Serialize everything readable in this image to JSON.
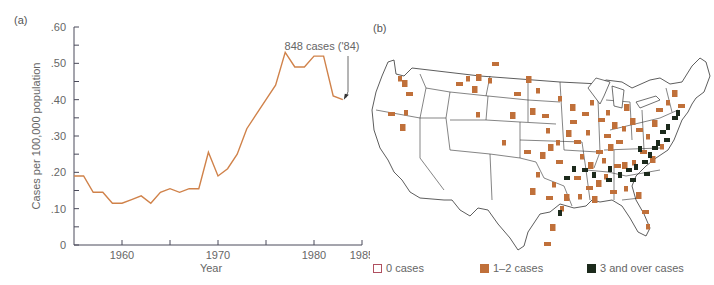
{
  "panel_a_label": "(a)",
  "panel_b_label": "(b)",
  "chart_data": [
    {
      "type": "line",
      "title": "",
      "xlabel": "Year",
      "ylabel": "Cases per 100,000 population",
      "x": [
        1955,
        1956,
        1957,
        1958,
        1959,
        1960,
        1961,
        1962,
        1963,
        1964,
        1965,
        1966,
        1967,
        1968,
        1969,
        1970,
        1971,
        1972,
        1973,
        1974,
        1975,
        1976,
        1977,
        1978,
        1979,
        1980,
        1981,
        1982,
        1983
      ],
      "series": [
        {
          "name": "Cases per 100,000 population",
          "color": "#d0824a",
          "values": [
            0.19,
            0.19,
            0.145,
            0.145,
            0.115,
            0.115,
            0.125,
            0.135,
            0.115,
            0.145,
            0.155,
            0.145,
            0.155,
            0.155,
            0.255,
            0.19,
            0.21,
            0.25,
            0.32,
            0.36,
            0.4,
            0.44,
            0.53,
            0.49,
            0.49,
            0.52,
            0.52,
            0.41,
            0.4
          ]
        }
      ],
      "xlim": [
        1955,
        1985
      ],
      "ylim": [
        0,
        0.6
      ],
      "x_ticks": [
        1960,
        1965,
        1970,
        1975,
        1980,
        1985
      ],
      "x_tick_labels": [
        "1960",
        "",
        "1970",
        "",
        "1980",
        "1985"
      ],
      "y_ticks": [
        0,
        0.05,
        0.1,
        0.15,
        0.2,
        0.25,
        0.3,
        0.35,
        0.4,
        0.45,
        0.5,
        0.55,
        0.6
      ],
      "y_tick_labels": [
        "0",
        "",
        ".10",
        "",
        ".20",
        "",
        ".30",
        "",
        ".40",
        "",
        ".50",
        "",
        ".60"
      ],
      "grid": false,
      "annotations": [
        {
          "text": "848 cases ('84)",
          "x": 1983,
          "y": 0.4,
          "arrow": true
        }
      ]
    },
    {
      "type": "map",
      "title": "",
      "description": "US map of case counts by county",
      "legend": [
        {
          "label": "0 cases",
          "color": "#ffffff",
          "border": "#b05060"
        },
        {
          "label": "1–2 cases",
          "color": "#c0703a"
        },
        {
          "label": "3 and over cases",
          "color": "#1c2a1c"
        }
      ],
      "legend_position": "bottom"
    }
  ],
  "legend": {
    "zero": "0 cases",
    "one_two": "1–2 cases",
    "three_plus": "3 and over cases"
  }
}
